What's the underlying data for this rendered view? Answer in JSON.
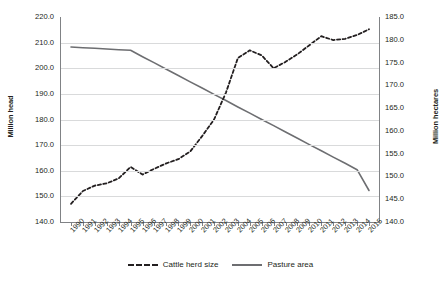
{
  "chart_data": {
    "type": "line",
    "title": "",
    "xlabel": "",
    "ylabel": "Million head",
    "y2label": "Million hectares",
    "grid": true,
    "legend_position": "bottom",
    "x": [
      1990,
      1991,
      1992,
      1993,
      1994,
      1995,
      1996,
      1997,
      1998,
      1999,
      2000,
      2001,
      2002,
      2003,
      2004,
      2005,
      2006,
      2007,
      2008,
      2009,
      2010,
      2011,
      2012,
      2013,
      2014,
      2015
    ],
    "xtick_labels": [
      "1990",
      "1991",
      "1992",
      "1993",
      "1994",
      "1995",
      "1996",
      "1997",
      "1998",
      "1999",
      "2000",
      "2001",
      "2002",
      "2003",
      "2004",
      "2005",
      "2006",
      "2007",
      "2008",
      "2009",
      "2010",
      "2011",
      "2012",
      "2013",
      "2014",
      "2015"
    ],
    "ylim": [
      140.0,
      220.0
    ],
    "ytick_labels": [
      "220.0",
      "210.0",
      "200.0",
      "190.0",
      "180.0",
      "170.0",
      "160.0",
      "150.0",
      "140.0"
    ],
    "ytick_values": [
      220.0,
      210.0,
      200.0,
      190.0,
      180.0,
      170.0,
      160.0,
      150.0,
      140.0
    ],
    "y2lim": [
      140.0,
      185.0
    ],
    "y2tick_labels": [
      "185.0",
      "180.0",
      "175.0",
      "170.0",
      "165.0",
      "160.0",
      "155.0",
      "150.0",
      "145.0",
      "140.0"
    ],
    "y2tick_values": [
      185.0,
      180.0,
      175.0,
      170.0,
      165.0,
      160.0,
      155.0,
      150.0,
      145.0,
      140.0
    ],
    "series": [
      {
        "name": "Cattle herd size",
        "axis": "left",
        "unit": "Million head",
        "style": "dashed",
        "color": "#231f20",
        "values": [
          147.1,
          152.1,
          154.2,
          155.1,
          157.0,
          161.5,
          158.5,
          160.8,
          162.9,
          164.5,
          167.5,
          173.5,
          180.0,
          190.5,
          204.0,
          207.0,
          205.0,
          200.0,
          202.5,
          205.5,
          209.0,
          212.5,
          211.0,
          211.5,
          213.0,
          215.2
        ]
      },
      {
        "name": "Pasture area",
        "axis": "right",
        "unit": "Million hectares",
        "style": "solid",
        "color": "#6d6e71",
        "values": [
          178.3,
          178.2,
          178.1,
          178.0,
          177.9,
          177.7,
          176.3,
          174.9,
          173.5,
          172.1,
          170.7,
          169.3,
          167.9,
          166.5,
          165.1,
          163.7,
          162.3,
          160.9,
          159.5,
          158.1,
          156.7,
          155.3,
          153.9,
          152.5,
          151.1,
          149.6
        ],
        "values_on_left_scale": [
          208.3,
          208.0,
          207.8,
          207.5,
          207.2,
          207.0,
          204.5,
          202.1,
          199.6,
          197.2,
          194.7,
          192.3,
          189.8,
          187.4,
          184.9,
          182.5,
          180.0,
          177.6,
          175.1,
          172.7,
          170.2,
          167.8,
          165.3,
          162.9,
          160.4,
          152.3
        ]
      }
    ]
  },
  "legend": {
    "items": [
      {
        "label": "Cattle herd size"
      },
      {
        "label": "Pasture area"
      }
    ]
  }
}
